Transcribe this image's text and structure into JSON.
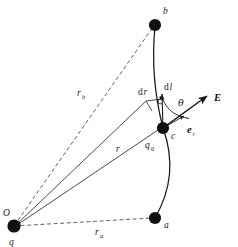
{
  "figure": {
    "background_color": "#ffffff",
    "ink_color": "#1a1a1a"
  },
  "points": [
    {
      "id": "b",
      "label": "b",
      "x": 155,
      "y": 25,
      "label_x": 163,
      "label_y": 13,
      "kind": "endpoint-top"
    },
    {
      "id": "c",
      "label": "c",
      "x": 163,
      "y": 128,
      "label_x": 172,
      "label_y": 137,
      "kind": "test-charge-position"
    },
    {
      "id": "a",
      "label": "a",
      "x": 155,
      "y": 218,
      "label_x": 165,
      "label_y": 227,
      "kind": "endpoint-bottom"
    },
    {
      "id": "O",
      "label": "O",
      "x": 14,
      "y": 226,
      "label_x": 4,
      "label_y": 216,
      "kind": "origin-source-charge"
    }
  ],
  "labels": {
    "origin": "O",
    "source_charge": "q",
    "test_charge": "q",
    "test_charge_sub": "0",
    "point_b": "b",
    "point_c": "c",
    "point_a": "a",
    "r_vector": "r",
    "r_b": "r",
    "r_b_sub": "b",
    "r_a": "r",
    "r_a_sub": "a",
    "dr": "d",
    "dr_italic": "r",
    "dl": "d",
    "dl_italic": "l",
    "theta": "θ",
    "field_vector": "E",
    "unit_vector": "e",
    "unit_vector_sub": "r"
  },
  "label_positions": {
    "source_charge": {
      "x": 10,
      "y": 244
    },
    "test_charge": {
      "x": 147,
      "y": 146
    },
    "r_vector": {
      "x": 117,
      "y": 150
    },
    "r_b": {
      "x": 79,
      "y": 95
    },
    "r_a": {
      "x": 96,
      "y": 233
    },
    "dr": {
      "x": 140,
      "y": 93
    },
    "dl": {
      "x": 166,
      "y": 88
    },
    "theta": {
      "x": 180,
      "y": 103
    },
    "field_vector": {
      "x": 216,
      "y": 100
    },
    "unit_vector": {
      "x": 188,
      "y": 131
    }
  },
  "segments": [
    {
      "name": "ray-O-to-b",
      "style": "dashed",
      "from": "O",
      "to": "b",
      "label": "r_b"
    },
    {
      "name": "ray-O-to-a",
      "style": "dashed",
      "from": "O",
      "to": "a",
      "label": "r_a"
    },
    {
      "name": "ray-O-to-c",
      "style": "solid",
      "from": "O",
      "to": "c",
      "label": "r",
      "arrowhead": "at-O"
    },
    {
      "name": "ray-O-to-dr-end",
      "style": "solid",
      "from": "O",
      "to": "dr-start",
      "label": "",
      "arrowhead": "at-O"
    },
    {
      "name": "arc-a-c-b",
      "style": "solid-curve",
      "from": "a",
      "to": "b",
      "label": "path"
    },
    {
      "name": "dl-segment",
      "style": "solid",
      "from": "c",
      "to": "dl-top",
      "label": "dl"
    },
    {
      "name": "dr-segment",
      "style": "solid",
      "from": "dr-start",
      "to": "dr-end",
      "label": "dr"
    },
    {
      "name": "E-arrow",
      "style": "solid-bold",
      "from": "c",
      "to": "E-tip",
      "label": "E"
    },
    {
      "name": "er-arrow",
      "style": "solid",
      "from": "c",
      "to": "er-tip",
      "label": "e_r"
    }
  ],
  "geometry": {
    "arc_control": {
      "x": 183,
      "y": 122
    },
    "dl_top": {
      "x": 163,
      "y": 96
    },
    "dr_start": {
      "x": 146,
      "y": 101
    },
    "dr_end": {
      "x": 163,
      "y": 98
    },
    "E_tip": {
      "x": 209,
      "y": 95
    },
    "er_tip": {
      "x": 186,
      "y": 115
    },
    "theta_arc_radius": 30,
    "right_angle_marker": {
      "x": 163,
      "y": 98,
      "size": 4
    }
  },
  "annotations": {
    "right_angle": "perpendicular-marker-at-dr-dl-junction",
    "theta_sweep": "angle between dl and E measured at point c"
  }
}
